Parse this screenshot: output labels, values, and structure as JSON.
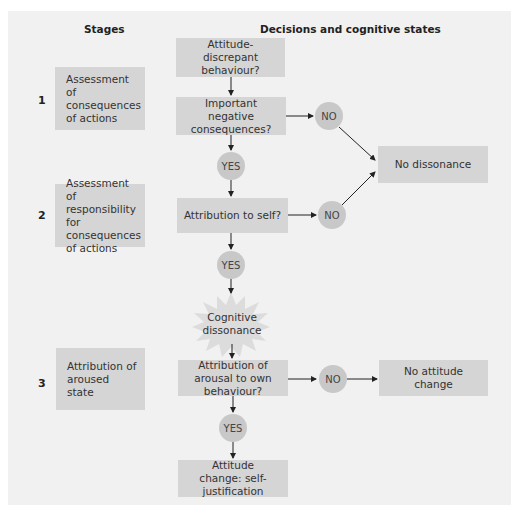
{
  "headers": {
    "stages": "Stages",
    "decisions": "Decisions and cognitive states"
  },
  "stages": [
    {
      "number": "1",
      "label": "Assessment of consequences of actions"
    },
    {
      "number": "2",
      "label": "Assessment of responsibility for consequences of actions"
    },
    {
      "number": "3",
      "label": "Attribution of aroused state"
    }
  ],
  "decisions": {
    "attitude_discrepant": "Attitude-discrepant behaviour?",
    "important_negative": "Important negative consequences?",
    "attribution_self": "Attribution to self?",
    "cognitive_dissonance": "Cognitive dissonance",
    "attribution_arousal": "Attribution of arousal to own behaviour?",
    "attitude_change": "Attitude change: self-justification"
  },
  "outcomes": {
    "no_dissonance": "No dissonance",
    "no_attitude_change": "No attitude change"
  },
  "answers": {
    "yes": "YES",
    "no": "NO"
  },
  "colors": {
    "panel_bg": "#f1f1f1",
    "box_fill": "#d5d5d5",
    "circle_fill": "#c8c8c8",
    "burst_fill": "#dcdcdc",
    "arrow": "#222222"
  }
}
